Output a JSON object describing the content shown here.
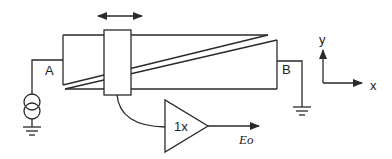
{
  "diagram": {
    "type": "potentiometer-schematic",
    "labels": {
      "terminal_a": "A",
      "terminal_b": "B",
      "buffer_gain": "1x",
      "output": "Eo",
      "axis_y": "y",
      "axis_x": "x"
    },
    "components": [
      {
        "name": "current-source",
        "symbol": "double-circle"
      },
      {
        "name": "resistive-element",
        "symbol": "wedge-strip"
      },
      {
        "name": "sliding-wiper",
        "symbol": "rectangle"
      },
      {
        "name": "buffer-amplifier",
        "symbol": "triangle"
      },
      {
        "name": "ground-a",
        "symbol": "ground"
      },
      {
        "name": "ground-b",
        "symbol": "ground"
      }
    ],
    "motion": "horizontal double-arrow",
    "colors": {
      "stroke": "#2a2a2a",
      "background": "#ffffff"
    }
  }
}
